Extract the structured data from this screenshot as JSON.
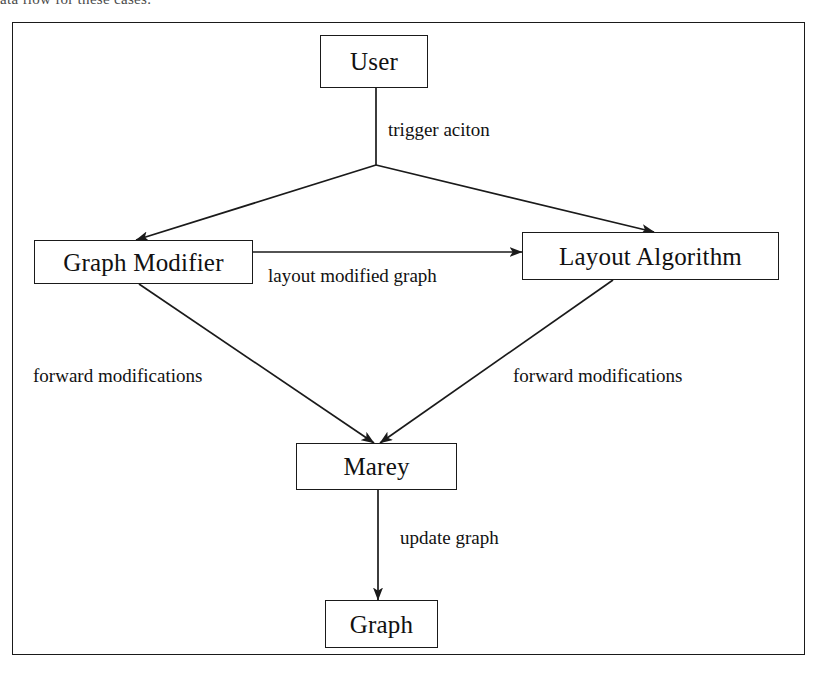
{
  "page": {
    "cropped_text_above_figure": "ata flow for these cases."
  },
  "figure": {
    "nodes": [
      {
        "id": "user",
        "label": "User"
      },
      {
        "id": "modifier",
        "label": "Graph Modifier"
      },
      {
        "id": "layout",
        "label": "Layout Algorithm"
      },
      {
        "id": "marey",
        "label": "Marey"
      },
      {
        "id": "graph",
        "label": "Graph"
      }
    ],
    "edges": [
      {
        "id": "user-to-modifier",
        "from": "user",
        "to": "modifier",
        "label": "trigger aciton"
      },
      {
        "id": "user-to-layout",
        "from": "user",
        "to": "layout",
        "label": ""
      },
      {
        "id": "modifier-to-layout",
        "from": "modifier",
        "to": "layout",
        "label": "layout modified graph"
      },
      {
        "id": "modifier-to-marey",
        "from": "modifier",
        "to": "marey",
        "label": "forward modifications"
      },
      {
        "id": "layout-to-marey",
        "from": "layout",
        "to": "marey",
        "label": "forward modifications"
      },
      {
        "id": "marey-to-graph",
        "from": "marey",
        "to": "graph",
        "label": "update graph"
      }
    ],
    "labels": {
      "trigger": "trigger aciton",
      "layout_modified_graph": "layout modified graph",
      "forward_modifications_left": "forward modifications",
      "forward_modifications_right": "forward modifications",
      "update_graph": "update graph"
    },
    "colors": {
      "stroke": "#1a1a1a",
      "background": "#ffffff",
      "text": "#111111"
    }
  }
}
